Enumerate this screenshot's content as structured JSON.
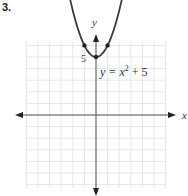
{
  "problem": {
    "number": "3."
  },
  "chart_data": {
    "type": "line",
    "title": "",
    "equation_label": "y = x² + 5",
    "equation_parts": {
      "lhs": "y = x",
      "exp": "2",
      "rhs": " + 5"
    },
    "xlabel": "x",
    "ylabel": "y",
    "y_tick_label": "5",
    "xlim": [
      -6,
      6
    ],
    "ylim": [
      -6,
      6
    ],
    "grid": true,
    "x": [
      -2.6,
      -2,
      -1,
      0,
      1,
      2,
      2.6
    ],
    "y": [
      11.76,
      9,
      6,
      5,
      6,
      9,
      11.76
    ],
    "marked_points": [
      [
        -1,
        6
      ],
      [
        0,
        5
      ],
      [
        1,
        6
      ]
    ],
    "colors": {
      "curve": "#3a3a3a",
      "grid": "#e6e6e6",
      "axis": "#555555"
    }
  }
}
